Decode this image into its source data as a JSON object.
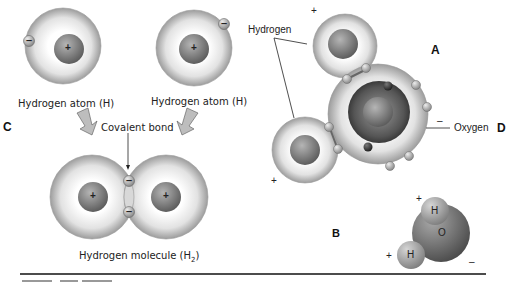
{
  "panels": {
    "left_label": "C",
    "right_label": "D",
    "water_model_label": "A",
    "space_fill_label": "B"
  },
  "left_diagram": {
    "atom_left_label": "Hydrogen atom (H)",
    "atom_right_label": "Hydrogen atom (H)",
    "bond_label": "Covalent bond",
    "molecule_label": "Hydrogen molecule (H",
    "molecule_subscript": "2",
    "molecule_label_end": ")",
    "nucleus_sign": "+",
    "electron_sign": "–"
  },
  "right_diagram": {
    "hydrogen_label": "Hydrogen",
    "oxygen_label": "Oxygen",
    "positive_sign": "+",
    "negative_sign": "–"
  },
  "space_fill_model": {
    "oxygen_symbol": "O",
    "hydrogen_symbol": "H",
    "positive_sign": "+",
    "negative_sign": "–"
  },
  "colors": {
    "shell_outer": "#9a9a9a",
    "shell_inner": "#f4f4f4",
    "nucleus": "#7b7b7b",
    "oxygen_core": "#555555",
    "line": "#111111"
  }
}
